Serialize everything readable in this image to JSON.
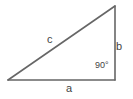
{
  "figure": {
    "background_color": "#ffffff",
    "line_color": "#666666",
    "text_color": "#444444"
  },
  "labels": {
    "hypotenuse": "c",
    "vertical_side": "b",
    "base_side": "a",
    "right_angle": "90°"
  },
  "geometry": {
    "vertices": {
      "left": [
        8,
        80
      ],
      "top_right": [
        115,
        6
      ],
      "bottom_right": [
        115,
        80
      ]
    },
    "stroke_width": 1.6
  }
}
